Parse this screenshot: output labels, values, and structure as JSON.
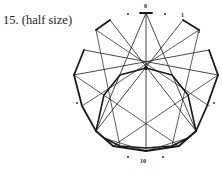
{
  "caption": "15. (half size)",
  "labels": {
    "top": "0",
    "upper_right_a": "1",
    "upper_right_b": "3",
    "bottom": "10"
  },
  "colors": {
    "line": "#1a1a1a",
    "background": "#ffffff"
  },
  "diagram": {
    "center": [
      146,
      75
    ],
    "outer_points": [
      [
        146,
        13
      ],
      [
        183,
        20
      ],
      [
        199,
        30
      ],
      [
        209,
        50
      ],
      [
        218,
        75
      ],
      [
        207,
        106
      ],
      [
        196,
        131
      ],
      [
        179,
        146
      ],
      [
        146,
        151
      ],
      [
        113,
        146
      ],
      [
        96,
        131
      ],
      [
        82,
        106
      ],
      [
        74,
        75
      ],
      [
        84,
        50
      ],
      [
        96,
        30
      ],
      [
        110,
        20
      ]
    ],
    "heavy_polyline": [
      [
        96,
        30
      ],
      [
        84,
        50
      ],
      [
        74,
        75
      ],
      [
        82,
        106
      ],
      [
        96,
        131
      ],
      [
        113,
        146
      ],
      [
        146,
        151
      ],
      [
        179,
        146
      ],
      [
        196,
        131
      ],
      [
        207,
        106
      ],
      [
        218,
        75
      ]
    ]
  }
}
